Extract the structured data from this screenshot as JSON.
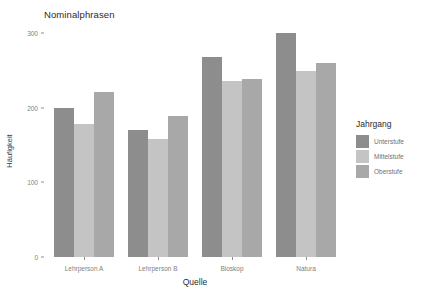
{
  "chart_data": {
    "type": "bar",
    "title": "Nominalphrasen",
    "xlabel": "Quelle",
    "ylabel": "Häufigkeit",
    "categories": [
      "Lehrperson A",
      "Lehrperson B",
      "Bioskop",
      "Natura"
    ],
    "series": [
      {
        "name": "Unterstufe",
        "color": "#8d8d8d",
        "values": [
          200,
          170,
          268,
          300
        ]
      },
      {
        "name": "Mittelstufe",
        "color": "#c4c4c4",
        "values": [
          179,
          159,
          236,
          250
        ]
      },
      {
        "name": "Oberstufe",
        "color": "#a8a8a8",
        "values": [
          222,
          189,
          239,
          260
        ]
      }
    ],
    "ylim": [
      0,
      310
    ],
    "yticks": [
      0,
      100,
      200,
      300
    ],
    "ytick_labels": [
      "0",
      "100",
      "200",
      "300"
    ],
    "grid": false,
    "legend_position": "right",
    "legend_title": "Jahrgang",
    "panel_background": "#ffffff",
    "plot_background": "#ffffff"
  }
}
